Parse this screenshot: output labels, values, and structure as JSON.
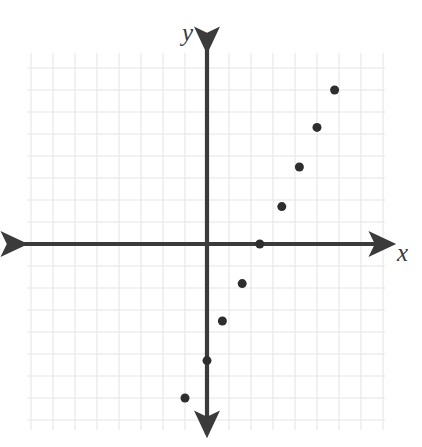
{
  "figure": {
    "kind": "coordinate-plane-scatter-plot",
    "background_color": "#ffffff",
    "grid_color": "#e6e6ea",
    "axis_color": "#3b3b3b",
    "point_color": "#2e2e2e",
    "width": 422,
    "height": 447
  },
  "labels": {
    "y_axis": "y",
    "x_axis": "x"
  },
  "chart_data": {
    "type": "scatter",
    "title": "",
    "xlabel": "x",
    "ylabel": "y",
    "grid": true,
    "legend": "none",
    "xlim": [
      -8.2,
      8.1
    ],
    "ylim": [
      -9.2,
      8.7
    ],
    "gridline_step": 1,
    "tick_labels_shown": false,
    "origin_px": [
      207,
      244
    ],
    "units_per_pixel": 22,
    "points": [
      {
        "x": -1.0,
        "y": -7.0
      },
      {
        "x": 0.0,
        "y": -5.3
      },
      {
        "x": 0.7,
        "y": -3.5
      },
      {
        "x": 1.6,
        "y": -1.8
      },
      {
        "x": 2.4,
        "y": 0.0
      },
      {
        "x": 3.4,
        "y": 1.7
      },
      {
        "x": 4.2,
        "y": 3.5
      },
      {
        "x": 5.0,
        "y": 5.3
      },
      {
        "x": 5.8,
        "y": 7.0
      }
    ],
    "point_radius_px": 4.5
  },
  "geometry": {
    "grid_left": 27,
    "grid_top": 53,
    "grid_right": 385,
    "grid_bottom": 430,
    "x_axis_start": 24,
    "x_axis_end": 392,
    "y_axis_start": 50,
    "y_axis_end": 434
  }
}
